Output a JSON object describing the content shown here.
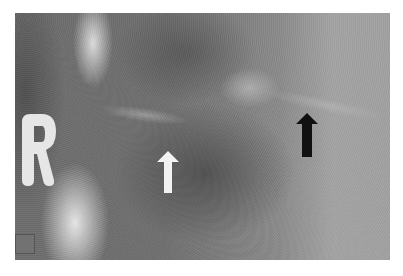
{
  "image": {
    "type": "radiograph",
    "side_marker": "R",
    "annotations": [
      {
        "name": "white-arrow",
        "color": "#f2f2f2",
        "direction": "up"
      },
      {
        "name": "black-arrow",
        "color": "#111111",
        "direction": "up"
      }
    ],
    "calibration_square_color": "#727272"
  }
}
